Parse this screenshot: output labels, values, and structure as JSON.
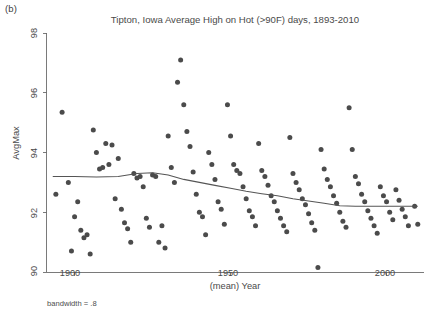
{
  "figure": {
    "panel_label": "(b)",
    "footnote": "bandwidth = .8"
  },
  "chart_data": {
    "type": "scatter",
    "title": "Tipton, Iowa Average High on Hot (>90F) days, 1893-2010",
    "xlabel": "(mean) Year",
    "ylabel": "AvgMax",
    "xlim": [
      1891,
      2012
    ],
    "ylim": [
      90,
      98
    ],
    "xticks": [
      1900,
      1950,
      2000
    ],
    "xtick_labels": [
      "1900",
      "1950",
      "2000"
    ],
    "yticks": [
      90,
      92,
      94,
      96,
      98
    ],
    "ytick_labels": [
      "90",
      "92",
      "94",
      "96",
      "98"
    ],
    "grid": false,
    "legend": null,
    "marker_color": "#4b4b4b",
    "smoother": {
      "name": "lowess",
      "bandwidth": 0.8,
      "line_color": "#555555",
      "x": [
        1893,
        1900,
        1907,
        1914,
        1920,
        1925,
        1930,
        1935,
        1940,
        1945,
        1950,
        1955,
        1960,
        1965,
        1970,
        1975,
        1980,
        1985,
        1990,
        1995,
        2000,
        2005,
        2010
      ],
      "y": [
        93.2,
        93.2,
        93.18,
        93.2,
        93.3,
        93.32,
        93.25,
        93.1,
        93.0,
        92.9,
        92.8,
        92.7,
        92.62,
        92.55,
        92.45,
        92.38,
        92.3,
        92.22,
        92.2,
        92.2,
        92.2,
        92.2,
        92.2
      ]
    },
    "series": [
      {
        "name": "AvgMax by year",
        "points": [
          [
            1894,
            92.6
          ],
          [
            1896,
            95.35
          ],
          [
            1898,
            93.0
          ],
          [
            1899,
            90.7
          ],
          [
            1900,
            91.85
          ],
          [
            1901,
            92.35
          ],
          [
            1902,
            91.4
          ],
          [
            1903,
            91.15
          ],
          [
            1904,
            91.25
          ],
          [
            1905,
            90.6
          ],
          [
            1906,
            94.75
          ],
          [
            1907,
            94.0
          ],
          [
            1908,
            93.45
          ],
          [
            1909,
            93.5
          ],
          [
            1910,
            94.3
          ],
          [
            1911,
            93.6
          ],
          [
            1912,
            94.25
          ],
          [
            1913,
            92.45
          ],
          [
            1914,
            93.8
          ],
          [
            1915,
            92.1
          ],
          [
            1916,
            91.65
          ],
          [
            1917,
            91.45
          ],
          [
            1918,
            91.0
          ],
          [
            1919,
            93.3
          ],
          [
            1920,
            93.15
          ],
          [
            1921,
            93.2
          ],
          [
            1922,
            92.85
          ],
          [
            1923,
            91.8
          ],
          [
            1924,
            91.5
          ],
          [
            1925,
            93.25
          ],
          [
            1926,
            93.2
          ],
          [
            1927,
            91.0
          ],
          [
            1928,
            91.55
          ],
          [
            1929,
            90.8
          ],
          [
            1930,
            94.55
          ],
          [
            1931,
            93.5
          ],
          [
            1932,
            93.0
          ],
          [
            1933,
            96.35
          ],
          [
            1934,
            97.1
          ],
          [
            1935,
            95.6
          ],
          [
            1936,
            94.7
          ],
          [
            1937,
            94.2
          ],
          [
            1938,
            93.35
          ],
          [
            1939,
            92.6
          ],
          [
            1940,
            92.0
          ],
          [
            1941,
            91.85
          ],
          [
            1942,
            91.25
          ],
          [
            1943,
            94.0
          ],
          [
            1944,
            93.6
          ],
          [
            1945,
            93.1
          ],
          [
            1946,
            92.35
          ],
          [
            1947,
            92.1
          ],
          [
            1948,
            91.6
          ],
          [
            1949,
            95.6
          ],
          [
            1950,
            94.55
          ],
          [
            1951,
            93.6
          ],
          [
            1952,
            93.4
          ],
          [
            1953,
            93.3
          ],
          [
            1954,
            92.85
          ],
          [
            1955,
            92.45
          ],
          [
            1956,
            92.05
          ],
          [
            1957,
            91.85
          ],
          [
            1958,
            91.55
          ],
          [
            1959,
            94.3
          ],
          [
            1960,
            93.4
          ],
          [
            1961,
            93.2
          ],
          [
            1962,
            92.9
          ],
          [
            1963,
            92.55
          ],
          [
            1964,
            92.35
          ],
          [
            1965,
            92.05
          ],
          [
            1966,
            91.8
          ],
          [
            1967,
            91.55
          ],
          [
            1968,
            91.35
          ],
          [
            1969,
            94.5
          ],
          [
            1970,
            93.3
          ],
          [
            1971,
            93.0
          ],
          [
            1972,
            92.75
          ],
          [
            1973,
            92.45
          ],
          [
            1974,
            92.25
          ],
          [
            1975,
            91.95
          ],
          [
            1976,
            91.65
          ],
          [
            1977,
            91.4
          ],
          [
            1978,
            90.15
          ],
          [
            1979,
            94.1
          ],
          [
            1980,
            93.45
          ],
          [
            1981,
            93.1
          ],
          [
            1982,
            92.85
          ],
          [
            1983,
            92.55
          ],
          [
            1984,
            92.3
          ],
          [
            1985,
            92.0
          ],
          [
            1986,
            91.7
          ],
          [
            1987,
            91.5
          ],
          [
            1988,
            95.5
          ],
          [
            1989,
            94.1
          ],
          [
            1990,
            93.2
          ],
          [
            1991,
            92.95
          ],
          [
            1992,
            92.6
          ],
          [
            1993,
            92.35
          ],
          [
            1994,
            92.05
          ],
          [
            1995,
            91.8
          ],
          [
            1996,
            91.55
          ],
          [
            1997,
            91.3
          ],
          [
            1998,
            92.85
          ],
          [
            1999,
            92.55
          ],
          [
            2000,
            92.35
          ],
          [
            2001,
            92.0
          ],
          [
            2002,
            91.75
          ],
          [
            2003,
            92.75
          ],
          [
            2004,
            92.4
          ],
          [
            2005,
            92.1
          ],
          [
            2006,
            91.85
          ],
          [
            2007,
            91.55
          ],
          [
            2009,
            92.2
          ],
          [
            2010,
            91.6
          ]
        ]
      }
    ]
  }
}
